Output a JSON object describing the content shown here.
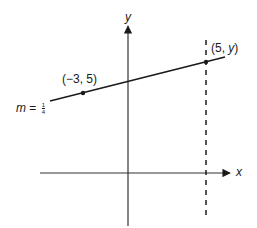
{
  "diagram": {
    "axes": {
      "x_label": "x",
      "y_label": "y"
    },
    "points": [
      {
        "label": "(−3, 5)"
      },
      {
        "label_prefix": "(5, ",
        "label_var": "y",
        "label_suffix": ")"
      }
    ],
    "slope": {
      "var": "m",
      "equals": " = ",
      "numerator": "1",
      "denominator": "4"
    },
    "colors": {
      "line": "#1a1a1a",
      "axis": "#333333"
    }
  }
}
